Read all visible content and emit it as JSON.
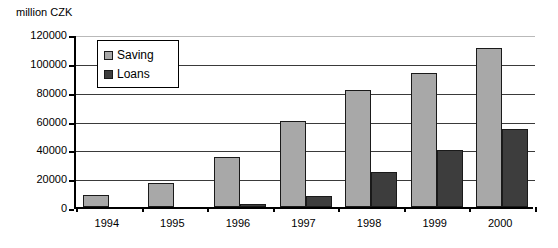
{
  "chart_data": {
    "type": "bar",
    "title": "",
    "subtitle": "",
    "unit_label": "million CZK",
    "xlabel": "",
    "ylabel": "million CZK",
    "categories": [
      "1994",
      "1995",
      "1996",
      "1997",
      "1998",
      "1999",
      "2000"
    ],
    "series": [
      {
        "name": "Saving",
        "color": "#a8a8a8",
        "values": [
          8500,
          16500,
          35000,
          60000,
          81000,
          93000,
          110000
        ]
      },
      {
        "name": "Loans",
        "color": "#3d3d3d",
        "values": [
          0,
          0,
          2000,
          7500,
          24500,
          39500,
          54000
        ]
      }
    ],
    "ylim": [
      0,
      120000
    ],
    "ytick_values": [
      0,
      20000,
      40000,
      60000,
      80000,
      100000,
      120000
    ],
    "ytick_labels": [
      "0",
      "20000",
      "40000",
      "60000",
      "80000",
      "100000",
      "120000"
    ],
    "grid": true,
    "grid_axis": "y",
    "legend_position": "upper-left-inside",
    "legend_entries": [
      "Saving",
      "Loans"
    ]
  }
}
